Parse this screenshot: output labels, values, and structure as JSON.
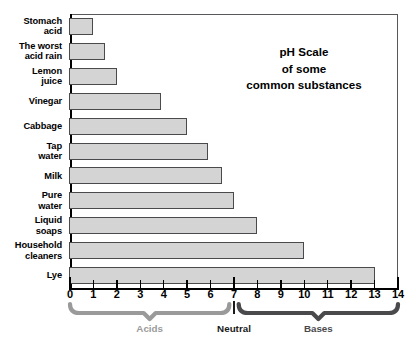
{
  "title": {
    "line1": "pH Scale",
    "line2": "of some",
    "line3": "common substances"
  },
  "chart_data": {
    "type": "bar",
    "orientation": "horizontal",
    "title": "pH Scale of some common substances",
    "xlabel": "",
    "ylabel": "",
    "xlim": [
      0,
      14
    ],
    "grid": false,
    "legend": null,
    "xticks": [
      0,
      1,
      2,
      3,
      4,
      5,
      6,
      7,
      8,
      9,
      10,
      11,
      12,
      13,
      14
    ],
    "xtick_labels": [
      "0",
      "1",
      "2",
      "3",
      "4",
      "5",
      "6",
      "7",
      "8",
      "9",
      "10",
      "11",
      "12",
      "13",
      "14"
    ],
    "categories": [
      "Stomach acid",
      "The worst acid rain",
      "Lemon juice",
      "Vinegar",
      "Cabbage",
      "Tap water",
      "Milk",
      "Pure water",
      "Liquid soaps",
      "Household cleaners",
      "Lye"
    ],
    "values": [
      1,
      1.5,
      2,
      3.9,
      5,
      5.9,
      6.5,
      7,
      8,
      10,
      13
    ],
    "bar_fill": "#d4d4d4",
    "bar_edge": "#4a4a4c"
  },
  "row_labels": [
    {
      "l1": "Stomach",
      "l2": "acid"
    },
    {
      "l1": "The worst",
      "l2": "acid rain"
    },
    {
      "l1": "Lemon",
      "l2": "juice"
    },
    {
      "l1": "Vinegar",
      "l2": ""
    },
    {
      "l1": "Cabbage",
      "l2": ""
    },
    {
      "l1": "Tap",
      "l2": "water"
    },
    {
      "l1": "Milk",
      "l2": ""
    },
    {
      "l1": "Pure",
      "l2": "water"
    },
    {
      "l1": "Liquid",
      "l2": "soaps"
    },
    {
      "l1": "Household",
      "l2": "cleaners"
    },
    {
      "l1": "Lye",
      "l2": ""
    }
  ],
  "brackets": [
    {
      "label": "Acids",
      "from": 0,
      "to": 6.8,
      "color": "#9a9a9a"
    },
    {
      "label": "Neutral",
      "from": 7,
      "to": 7,
      "color": "#1a1a1a"
    },
    {
      "label": "Bases",
      "from": 7.2,
      "to": 14,
      "color": "#4a4a4c"
    }
  ]
}
